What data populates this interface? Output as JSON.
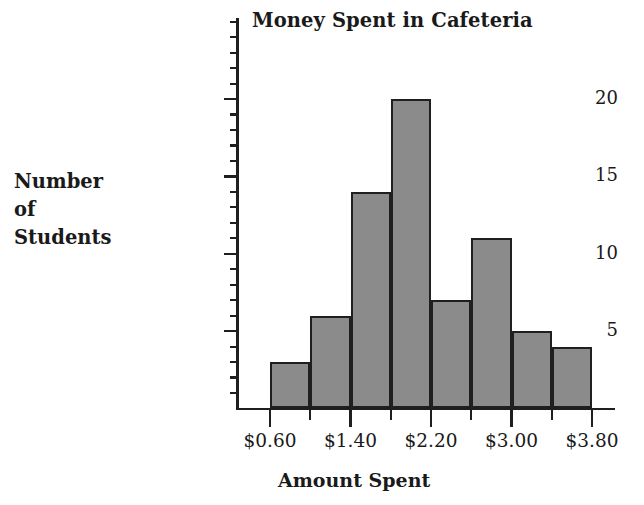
{
  "chart_data": {
    "type": "bar",
    "title": "Money Spent in Cafeteria",
    "xlabel": "Amount Spent",
    "ylabel": "Number of Students",
    "ylabel_lines": [
      "Number",
      "of",
      "Students"
    ],
    "categories": [
      "$0.60-$1.00",
      "$1.00-$1.40",
      "$1.40-$1.80",
      "$1.80-$2.20",
      "$2.20-$2.60",
      "$2.60-$3.00",
      "$3.00-$3.40",
      "$3.40-$3.80"
    ],
    "values": [
      3,
      6,
      14,
      20,
      7,
      11,
      5,
      4
    ],
    "bin_edges": [
      0.6,
      1.0,
      1.4,
      1.8,
      2.2,
      2.6,
      3.0,
      3.4,
      3.8
    ],
    "ylim": [
      0,
      23
    ],
    "xlim": [
      0.6,
      3.8
    ],
    "y_major_ticks": [
      5,
      10,
      15,
      20
    ],
    "y_major_tick_labels": [
      "5",
      "10",
      "15",
      "20"
    ],
    "y_minor_tick_interval": 1,
    "x_major_ticks": [
      0.6,
      1.4,
      2.2,
      3.0,
      3.8
    ],
    "x_major_tick_labels": [
      "$0.60",
      "$1.40",
      "$2.20",
      "$3.00",
      "$3.80"
    ],
    "x_minor_ticks": [
      1.0,
      1.8,
      2.6,
      3.4
    ],
    "grid": false,
    "legend": false,
    "bar_fill_color": "#8b8b8b",
    "bar_edge_color": "#1f1f1f",
    "axis_color": "#1f1f1f",
    "background_color": "#ffffff"
  }
}
